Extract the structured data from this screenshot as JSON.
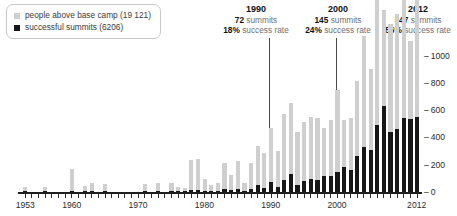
{
  "legend": {
    "items": [
      {
        "label": "people above base camp (19 121)",
        "color": "#cfcfcf",
        "swatch": "square-swatch"
      },
      {
        "label": "successful summits (6206)",
        "color": "#171717",
        "swatch": "square-swatch"
      }
    ]
  },
  "annotations": [
    {
      "year": "1990",
      "summits": "72",
      "summits_suffix": "summits",
      "rate": "18%",
      "rate_suffix": "success rate"
    },
    {
      "year": "2000",
      "summits": "145",
      "summits_suffix": "summits",
      "rate": "24%",
      "rate_suffix": "success rate"
    },
    {
      "year": "2012",
      "summits": "547",
      "summits_suffix": "summits",
      "rate": "56%",
      "rate_suffix": "success rate"
    }
  ],
  "chart_data": {
    "type": "bar",
    "subtype": "stacked",
    "title": "",
    "xlabel": "",
    "ylabel": "",
    "ylim": [
      0,
      1070
    ],
    "yticks": [
      0,
      200,
      400,
      600,
      800,
      1000
    ],
    "ytick_labels": [
      "0",
      "200",
      "400",
      "600",
      "800",
      "1000"
    ],
    "grid": false,
    "legend_position": "top-left",
    "xtick_labels": [
      "1953",
      "1960",
      "1970",
      "1980",
      "1990",
      "2000",
      "2012"
    ],
    "xtick_years": [
      1953,
      1960,
      1970,
      1980,
      1990,
      2000,
      2012
    ],
    "x": [
      1953,
      1954,
      1955,
      1956,
      1957,
      1958,
      1959,
      1960,
      1961,
      1962,
      1963,
      1964,
      1965,
      1966,
      1967,
      1968,
      1969,
      1970,
      1971,
      1972,
      1973,
      1974,
      1975,
      1976,
      1977,
      1978,
      1979,
      1980,
      1981,
      1982,
      1983,
      1984,
      1985,
      1986,
      1987,
      1988,
      1989,
      1990,
      1991,
      1992,
      1993,
      1994,
      1995,
      1996,
      1997,
      1998,
      1999,
      2000,
      2001,
      2002,
      2003,
      2004,
      2005,
      2006,
      2007,
      2008,
      2009,
      2010,
      2011,
      2012
    ],
    "categories": [
      "1953",
      "1954",
      "1955",
      "1956",
      "1957",
      "1958",
      "1959",
      "1960",
      "1961",
      "1962",
      "1963",
      "1964",
      "1965",
      "1966",
      "1967",
      "1968",
      "1969",
      "1970",
      "1971",
      "1972",
      "1973",
      "1974",
      "1975",
      "1976",
      "1977",
      "1978",
      "1979",
      "1980",
      "1981",
      "1982",
      "1983",
      "1984",
      "1985",
      "1986",
      "1987",
      "1988",
      "1989",
      "1990",
      "1991",
      "1992",
      "1993",
      "1994",
      "1995",
      "1996",
      "1997",
      "1998",
      "1999",
      "2000",
      "2001",
      "2002",
      "2003",
      "2004",
      "2005",
      "2006",
      "2007",
      "2008",
      "2009",
      "2010",
      "2011",
      "2012"
    ],
    "series": [
      {
        "name": "successful summits (6206)",
        "color": "#171717",
        "values": [
          4,
          0,
          0,
          4,
          0,
          0,
          0,
          4,
          0,
          2,
          6,
          0,
          5,
          0,
          0,
          0,
          0,
          0,
          2,
          0,
          8,
          0,
          9,
          3,
          2,
          18,
          12,
          6,
          5,
          6,
          22,
          13,
          20,
          4,
          19,
          50,
          26,
          72,
          38,
          90,
          129,
          51,
          83,
          98,
          85,
          120,
          116,
          145,
          182,
          159,
          266,
          330,
          305,
          494,
          633,
          440,
          463,
          543,
          538,
          547
        ]
      },
      {
        "name": "people above base camp (19 121)",
        "color": "#cfcfcf",
        "values": [
          30,
          0,
          0,
          30,
          0,
          0,
          0,
          160,
          0,
          35,
          60,
          0,
          50,
          0,
          0,
          0,
          0,
          0,
          50,
          0,
          60,
          0,
          55,
          30,
          20,
          215,
          230,
          90,
          40,
          55,
          190,
          115,
          210,
          55,
          195,
          285,
          260,
          400,
          260,
          480,
          520,
          390,
          430,
          455,
          460,
          350,
          415,
          600,
          345,
          385,
          550,
          810,
          600,
          1060,
          700,
          790,
          845,
          880,
          570,
          960
        ]
      }
    ],
    "totals_note": {
      "people_above_base_camp_total": "19 121",
      "successful_summits_total": "6206"
    }
  }
}
